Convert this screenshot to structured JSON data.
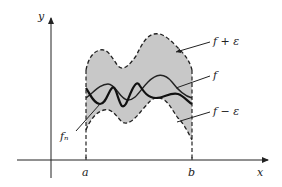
{
  "diagram": {
    "axes": {
      "x_label": "x",
      "y_label": "y"
    },
    "ticks": {
      "a_label": "a",
      "b_label": "b"
    },
    "curve_labels": {
      "upper_band": "f + ε",
      "function": "f",
      "lower_band": "f − ε",
      "approximant": "fₙ"
    },
    "colors": {
      "band_fill": "#c8c8c8",
      "stroke": "#222222",
      "background": "#ffffff"
    }
  }
}
